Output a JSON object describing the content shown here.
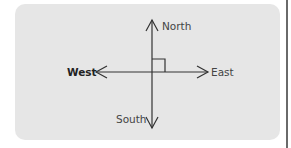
{
  "diagram": {
    "type": "compass-directions",
    "labels": {
      "north": "North",
      "south": "South",
      "east": "East",
      "west": "West"
    },
    "emphasized_label": "West",
    "right_angle_marker": true,
    "colors": {
      "panel_background": "#e6e6e6",
      "line": "#333333",
      "text": "#444444"
    }
  }
}
